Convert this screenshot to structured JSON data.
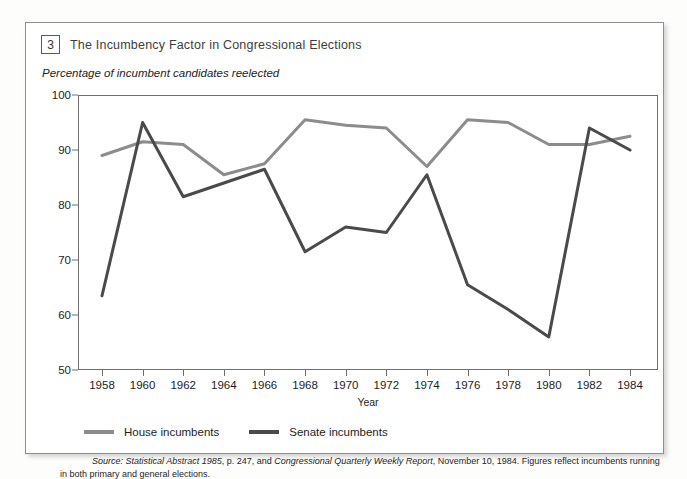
{
  "figure": {
    "number": "3",
    "title": "The Incumbency Factor in Congressional Elections",
    "subtitle": "Percentage of incumbent candidates reelected"
  },
  "legend": {
    "house_label": "House incumbents",
    "senate_label": "Senate incumbents",
    "house_color": "#8c8c8c",
    "senate_color": "#4a4a4a"
  },
  "source": {
    "lead": "Source:",
    "italic_one": "Statistical Abstract 1985",
    "mid": ", p. 247, and ",
    "italic_two": "Congressional Quarterly Weekly Report",
    "tail": ", November 10, 1984. Figures reflect incumbents running in both",
    "line_two": "primary and general elections."
  },
  "chart_data": {
    "type": "line",
    "title": "The Incumbency Factor in Congressional Elections",
    "subtitle": "Percentage of incumbent candidates reelected",
    "xlabel": "Year",
    "ylabel": "",
    "xlim": [
      1958,
      1984
    ],
    "ylim": [
      50,
      100
    ],
    "yticks": [
      50,
      60,
      70,
      80,
      90,
      100
    ],
    "grid": false,
    "legend_position": "below-plot-left",
    "x": [
      1958,
      1960,
      1962,
      1964,
      1966,
      1968,
      1970,
      1972,
      1974,
      1976,
      1978,
      1980,
      1982,
      1984
    ],
    "categories": [
      "1958",
      "1960",
      "1962",
      "1964",
      "1966",
      "1968",
      "1970",
      "1972",
      "1974",
      "1976",
      "1978",
      "1980",
      "1982",
      "1984"
    ],
    "series": [
      {
        "name": "House incumbents",
        "color": "#8c8c8c",
        "values": [
          89.0,
          91.5,
          91.0,
          85.5,
          87.5,
          95.5,
          94.5,
          94.0,
          87.0,
          95.5,
          95.0,
          91.0,
          91.0,
          92.5
        ]
      },
      {
        "name": "Senate incumbents",
        "color": "#4a4a4a",
        "values": [
          63.5,
          95.0,
          81.5,
          84.0,
          86.5,
          71.5,
          76.0,
          75.0,
          85.5,
          65.5,
          61.0,
          56.0,
          94.0,
          90.0
        ]
      }
    ]
  }
}
